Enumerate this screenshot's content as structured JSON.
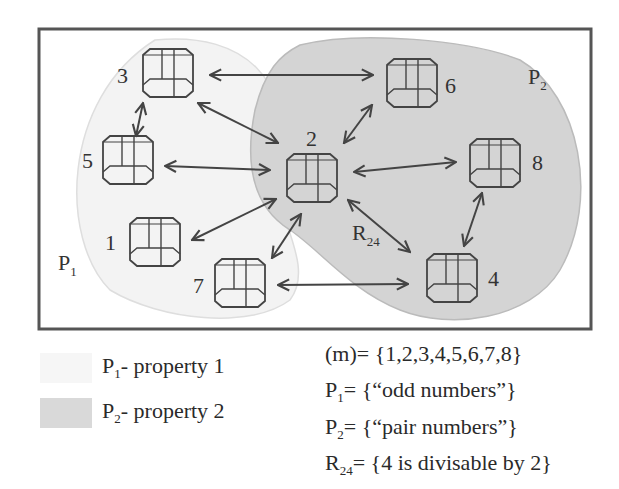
{
  "diagram": {
    "regions": [
      {
        "id": "P1",
        "label": "P",
        "sub": "1",
        "fill": "#f3f3f3"
      },
      {
        "id": "P2",
        "label": "P",
        "sub": "2",
        "fill": "#d4d4d4"
      }
    ],
    "nodes": [
      {
        "id": "1",
        "label": "1",
        "x": 155,
        "y": 218
      },
      {
        "id": "2",
        "label": "2",
        "x": 312,
        "y": 158
      },
      {
        "id": "3",
        "label": "3",
        "x": 168,
        "y": 65
      },
      {
        "id": "4",
        "label": "4",
        "x": 452,
        "y": 258
      },
      {
        "id": "5",
        "label": "5",
        "x": 128,
        "y": 160
      },
      {
        "id": "6",
        "label": "6",
        "x": 412,
        "y": 75
      },
      {
        "id": "7",
        "label": "7",
        "x": 240,
        "y": 282
      },
      {
        "id": "8",
        "label": "8",
        "x": 495,
        "y": 150
      }
    ],
    "edges": [
      [
        "3",
        "6"
      ],
      [
        "3",
        "2"
      ],
      [
        "3",
        "5"
      ],
      [
        "5",
        "2"
      ],
      [
        "1",
        "2"
      ],
      [
        "7",
        "2"
      ],
      [
        "7",
        "4"
      ],
      [
        "2",
        "6"
      ],
      [
        "2",
        "8"
      ],
      [
        "2",
        "4"
      ],
      [
        "8",
        "4"
      ]
    ],
    "relation_label": {
      "text": "R",
      "sub": "24"
    }
  },
  "legend": [
    {
      "label_main": "P",
      "label_sub": "1",
      "label_rest": "- property 1",
      "color": "#f6f6f6"
    },
    {
      "label_main": "P",
      "label_sub": "2",
      "label_rest": "- property 2",
      "color": "#d9d9d9"
    }
  ],
  "definitions": [
    {
      "main": "(m)",
      "sub": "",
      "rest": "= {1,2,3,4,5,6,7,8}"
    },
    {
      "main": "P",
      "sub": "1",
      "rest": "= {“odd numbers”}"
    },
    {
      "main": "P",
      "sub": "2",
      "rest": "= {“pair numbers”}"
    },
    {
      "main": "R",
      "sub": "24",
      "rest": "= {4 is divisable by 2}"
    }
  ]
}
